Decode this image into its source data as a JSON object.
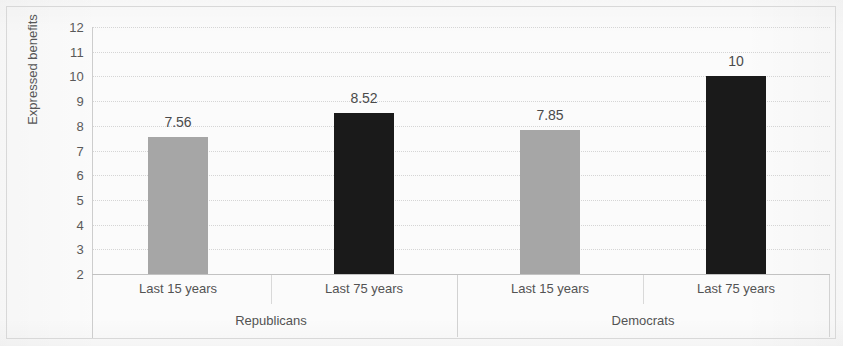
{
  "chart_data": {
    "type": "bar",
    "title": "",
    "subtitle": "",
    "xlabel": "",
    "ylabel": "Expressed benefits",
    "ylim": [
      2,
      12
    ],
    "ytick_labels": [
      "12",
      "11",
      "10",
      "9",
      "8",
      "7",
      "6",
      "5",
      "4",
      "3",
      "2"
    ],
    "ytick_values": [
      12,
      11,
      10,
      9,
      8,
      7,
      6,
      5,
      4,
      3,
      2
    ],
    "grid": true,
    "grid_axis": "y",
    "legend": "none",
    "group_labels": [
      "Republicans",
      "Democrats"
    ],
    "categories": [
      "Last 15 years",
      "Last 75 years",
      "Last 15 years",
      "Last 75 years"
    ],
    "values": [
      7.56,
      8.52,
      7.85,
      10
    ],
    "value_labels": [
      "7.56",
      "8.52",
      "7.85",
      "10"
    ],
    "bars": [
      {
        "group": "Republicans",
        "category": "Last 15 years",
        "value": 7.56,
        "label": "7.56",
        "color": "#a6a6a6"
      },
      {
        "group": "Republicans",
        "category": "Last 75 years",
        "value": 8.52,
        "label": "8.52",
        "color": "#1a1a1a"
      },
      {
        "group": "Democrats",
        "category": "Last 15 years",
        "value": 7.85,
        "label": "7.85",
        "color": "#a6a6a6"
      },
      {
        "group": "Democrats",
        "category": "Last 75 years",
        "value": 10,
        "label": "10",
        "color": "#1a1a1a"
      }
    ],
    "colors": {
      "bar_light": "#a6a6a6",
      "bar_dark": "#1a1a1a",
      "gridline": "#cfcfcf",
      "axis_text": "#565656",
      "border": "#d8d8d8",
      "background": "#fbfbfb"
    }
  }
}
